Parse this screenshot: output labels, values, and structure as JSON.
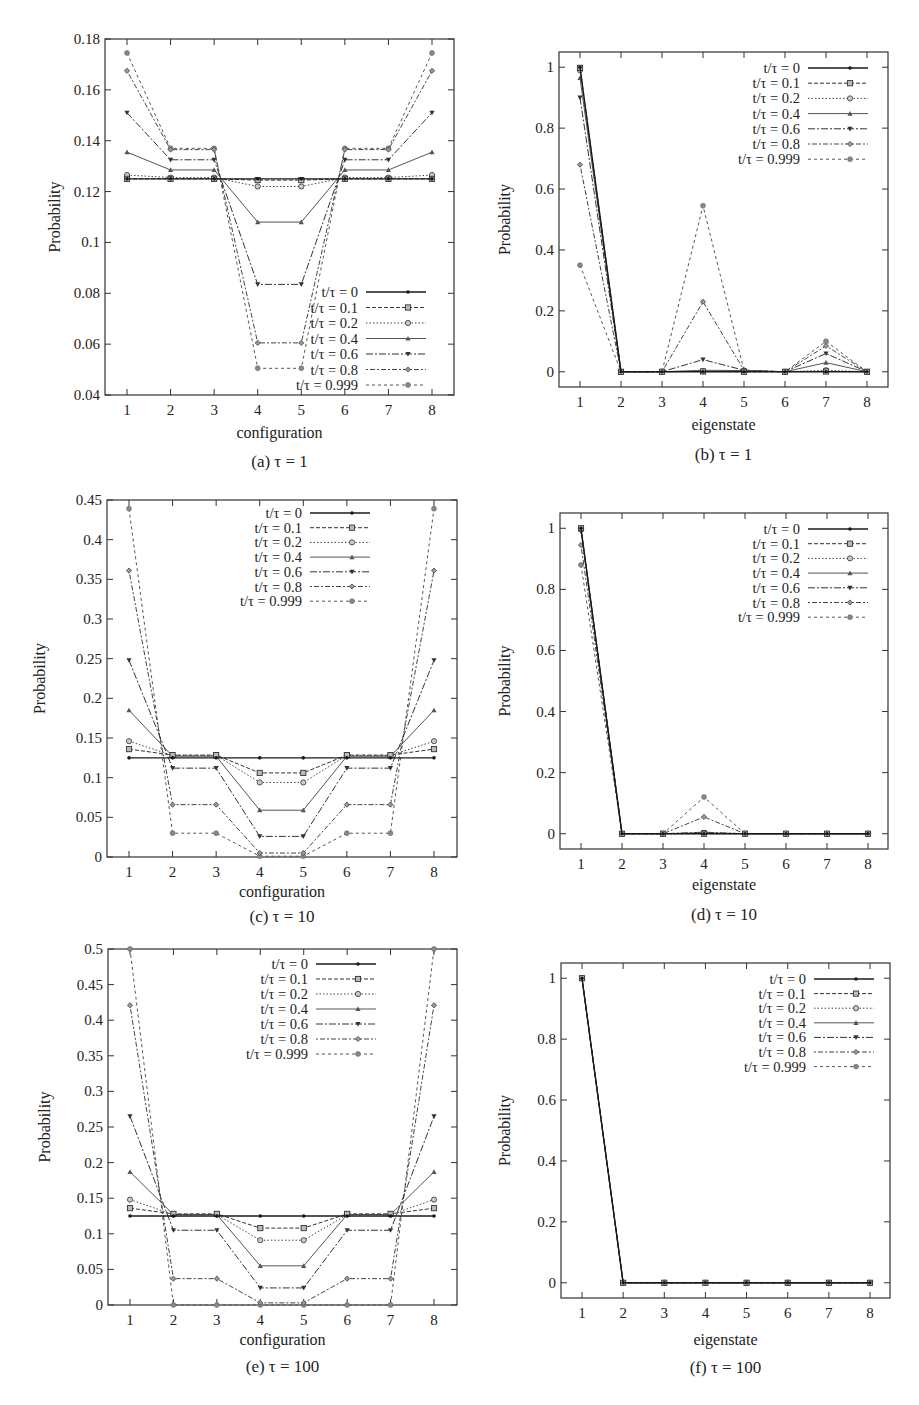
{
  "figure": {
    "series_labels": [
      "t/τ = 0",
      "t/τ = 0.1",
      "t/τ = 0.2",
      "t/τ = 0.4",
      "t/τ = 0.6",
      "t/τ = 0.8",
      "t/τ = 0.999"
    ]
  },
  "chart_data": [
    {
      "id": "a",
      "type": "line",
      "title": "(a) τ = 1",
      "xlabel": "configuration",
      "ylabel": "Probability",
      "categories": [
        1,
        2,
        3,
        4,
        5,
        6,
        7,
        8
      ],
      "ylim": [
        0.04,
        0.18
      ],
      "yticks": [
        0.04,
        0.06,
        0.08,
        0.1,
        0.12,
        0.14,
        0.16,
        0.18
      ],
      "ytick_labels": [
        "0.04",
        "0.06",
        "0.08",
        "0.1",
        "0.12",
        "0.14",
        "0.16",
        "0.18"
      ],
      "grid": false,
      "legend_position": "lower right",
      "series": [
        {
          "name": "t/τ = 0",
          "values": [
            0.125,
            0.125,
            0.125,
            0.125,
            0.125,
            0.125,
            0.125,
            0.125
          ]
        },
        {
          "name": "t/τ = 0.1",
          "values": [
            0.125,
            0.125,
            0.125,
            0.1245,
            0.1245,
            0.125,
            0.125,
            0.125
          ]
        },
        {
          "name": "t/τ = 0.2",
          "values": [
            0.1265,
            0.1255,
            0.1255,
            0.122,
            0.122,
            0.1255,
            0.1255,
            0.1265
          ]
        },
        {
          "name": "t/τ = 0.4",
          "values": [
            0.1355,
            0.1285,
            0.1285,
            0.108,
            0.108,
            0.1285,
            0.1285,
            0.1355
          ]
        },
        {
          "name": "t/τ = 0.6",
          "values": [
            0.151,
            0.1325,
            0.1325,
            0.0835,
            0.0835,
            0.1325,
            0.1325,
            0.151
          ]
        },
        {
          "name": "t/τ = 0.8",
          "values": [
            0.1675,
            0.1365,
            0.1365,
            0.0605,
            0.0605,
            0.1365,
            0.1365,
            0.1675
          ]
        },
        {
          "name": "t/τ = 0.999",
          "values": [
            0.1745,
            0.137,
            0.137,
            0.0505,
            0.0505,
            0.137,
            0.137,
            0.1745
          ]
        }
      ]
    },
    {
      "id": "b",
      "type": "line",
      "title": "(b) τ = 1",
      "xlabel": "eigenstate",
      "ylabel": "Probability",
      "categories": [
        1,
        2,
        3,
        4,
        5,
        6,
        7,
        8
      ],
      "ylim": [
        -0.05,
        1.05
      ],
      "yticks": [
        0,
        0.2,
        0.4,
        0.6,
        0.8,
        1
      ],
      "ytick_labels": [
        "0",
        "0.2",
        "0.4",
        "0.6",
        "0.8",
        "1"
      ],
      "grid": false,
      "legend_position": "upper right",
      "series": [
        {
          "name": "t/τ = 0",
          "values": [
            1.0,
            0,
            0,
            0,
            0,
            0,
            0,
            0
          ]
        },
        {
          "name": "t/τ = 0.1",
          "values": [
            0.998,
            0,
            0,
            0.001,
            0,
            0,
            0.001,
            0
          ]
        },
        {
          "name": "t/τ = 0.2",
          "values": [
            0.99,
            0,
            0,
            0.002,
            0.002,
            0,
            0.005,
            0
          ]
        },
        {
          "name": "t/τ = 0.4",
          "values": [
            0.965,
            0,
            0,
            0.005,
            0.004,
            0,
            0.03,
            0
          ]
        },
        {
          "name": "t/τ = 0.6",
          "values": [
            0.9,
            0,
            0,
            0.04,
            0.005,
            0,
            0.06,
            0
          ]
        },
        {
          "name": "t/τ = 0.8",
          "values": [
            0.68,
            0,
            0,
            0.23,
            0.005,
            0,
            0.085,
            0
          ]
        },
        {
          "name": "t/τ = 0.999",
          "values": [
            0.35,
            0,
            0,
            0.545,
            0.005,
            0,
            0.1,
            0
          ]
        }
      ]
    },
    {
      "id": "c",
      "type": "line",
      "title": "(c) τ = 10",
      "xlabel": "configuration",
      "ylabel": "Probability",
      "categories": [
        1,
        2,
        3,
        4,
        5,
        6,
        7,
        8
      ],
      "ylim": [
        0,
        0.45
      ],
      "yticks": [
        0,
        0.05,
        0.1,
        0.15,
        0.2,
        0.25,
        0.3,
        0.35,
        0.4,
        0.45
      ],
      "ytick_labels": [
        "0",
        "0.05",
        "0.1",
        "0.15",
        "0.2",
        "0.25",
        "0.3",
        "0.35",
        "0.4",
        "0.45"
      ],
      "grid": false,
      "legend_position": "upper center",
      "series": [
        {
          "name": "t/τ = 0",
          "values": [
            0.125,
            0.125,
            0.125,
            0.125,
            0.125,
            0.125,
            0.125,
            0.125
          ]
        },
        {
          "name": "t/τ = 0.1",
          "values": [
            0.136,
            0.1285,
            0.1285,
            0.106,
            0.106,
            0.1285,
            0.1285,
            0.136
          ]
        },
        {
          "name": "t/τ = 0.2",
          "values": [
            0.146,
            0.128,
            0.128,
            0.094,
            0.094,
            0.128,
            0.128,
            0.146
          ]
        },
        {
          "name": "t/τ = 0.4",
          "values": [
            0.185,
            0.127,
            0.127,
            0.059,
            0.059,
            0.127,
            0.127,
            0.185
          ]
        },
        {
          "name": "t/τ = 0.6",
          "values": [
            0.248,
            0.112,
            0.112,
            0.026,
            0.026,
            0.112,
            0.112,
            0.248
          ]
        },
        {
          "name": "t/τ = 0.8",
          "values": [
            0.361,
            0.066,
            0.066,
            0.005,
            0.005,
            0.066,
            0.066,
            0.361
          ]
        },
        {
          "name": "t/τ = 0.999",
          "values": [
            0.439,
            0.03,
            0.03,
            0.001,
            0.001,
            0.03,
            0.03,
            0.439
          ]
        }
      ]
    },
    {
      "id": "d",
      "type": "line",
      "title": "(d) τ = 10",
      "xlabel": "eigenstate",
      "ylabel": "Probability",
      "categories": [
        1,
        2,
        3,
        4,
        5,
        6,
        7,
        8
      ],
      "ylim": [
        -0.05,
        1.05
      ],
      "yticks": [
        0,
        0.2,
        0.4,
        0.6,
        0.8,
        1
      ],
      "ytick_labels": [
        "0",
        "0.2",
        "0.4",
        "0.6",
        "0.8",
        "1"
      ],
      "grid": false,
      "legend_position": "upper right",
      "series": [
        {
          "name": "t/τ = 0",
          "values": [
            1.0,
            0,
            0,
            0,
            0,
            0,
            0,
            0
          ]
        },
        {
          "name": "t/τ = 0.1",
          "values": [
            1.0,
            0,
            0,
            0.0,
            0,
            0,
            0,
            0
          ]
        },
        {
          "name": "t/τ = 0.2",
          "values": [
            0.999,
            0,
            0,
            0.001,
            0,
            0,
            0,
            0
          ]
        },
        {
          "name": "t/τ = 0.4",
          "values": [
            0.995,
            0,
            0,
            0.003,
            0,
            0,
            0,
            0
          ]
        },
        {
          "name": "t/τ = 0.6",
          "values": [
            0.99,
            0,
            0,
            0.005,
            0,
            0,
            0,
            0
          ]
        },
        {
          "name": "t/τ = 0.8",
          "values": [
            0.945,
            0,
            0,
            0.055,
            0,
            0,
            0,
            0
          ]
        },
        {
          "name": "t/τ = 0.999",
          "values": [
            0.88,
            0,
            0,
            0.12,
            0,
            0,
            0,
            0
          ]
        }
      ]
    },
    {
      "id": "e",
      "type": "line",
      "title": "(e) τ = 100",
      "xlabel": "configuration",
      "ylabel": "Probability",
      "categories": [
        1,
        2,
        3,
        4,
        5,
        6,
        7,
        8
      ],
      "ylim": [
        0,
        0.5
      ],
      "yticks": [
        0,
        0.05,
        0.1,
        0.15,
        0.2,
        0.25,
        0.3,
        0.35,
        0.4,
        0.45,
        0.5
      ],
      "ytick_labels": [
        "0",
        "0.05",
        "0.1",
        "0.15",
        "0.2",
        "0.25",
        "0.3",
        "0.35",
        "0.4",
        "0.45",
        "0.5"
      ],
      "grid": false,
      "legend_position": "upper center",
      "series": [
        {
          "name": "t/τ = 0",
          "values": [
            0.125,
            0.125,
            0.125,
            0.125,
            0.125,
            0.125,
            0.125,
            0.125
          ]
        },
        {
          "name": "t/τ = 0.1",
          "values": [
            0.136,
            0.128,
            0.128,
            0.108,
            0.108,
            0.128,
            0.128,
            0.136
          ]
        },
        {
          "name": "t/τ = 0.2",
          "values": [
            0.148,
            0.127,
            0.127,
            0.091,
            0.091,
            0.127,
            0.127,
            0.148
          ]
        },
        {
          "name": "t/τ = 0.4",
          "values": [
            0.187,
            0.127,
            0.127,
            0.055,
            0.055,
            0.127,
            0.127,
            0.187
          ]
        },
        {
          "name": "t/τ = 0.6",
          "values": [
            0.265,
            0.105,
            0.105,
            0.024,
            0.024,
            0.105,
            0.105,
            0.265
          ]
        },
        {
          "name": "t/τ = 0.8",
          "values": [
            0.421,
            0.037,
            0.037,
            0.003,
            0.003,
            0.037,
            0.037,
            0.421
          ]
        },
        {
          "name": "t/τ = 0.999",
          "values": [
            0.5,
            0.0,
            0.0,
            0.0,
            0.0,
            0.0,
            0.0,
            0.5
          ]
        }
      ]
    },
    {
      "id": "f",
      "type": "line",
      "title": "(f) τ = 100",
      "xlabel": "eigenstate",
      "ylabel": "Probability",
      "categories": [
        1,
        2,
        3,
        4,
        5,
        6,
        7,
        8
      ],
      "ylim": [
        -0.05,
        1.05
      ],
      "yticks": [
        0,
        0.2,
        0.4,
        0.6,
        0.8,
        1
      ],
      "ytick_labels": [
        "0",
        "0.2",
        "0.4",
        "0.6",
        "0.8",
        "1"
      ],
      "grid": false,
      "legend_position": "upper right",
      "series": [
        {
          "name": "t/τ = 0",
          "values": [
            1.0,
            0,
            0,
            0,
            0,
            0,
            0,
            0
          ]
        },
        {
          "name": "t/τ = 0.1",
          "values": [
            1.0,
            0,
            0,
            0,
            0,
            0,
            0,
            0
          ]
        },
        {
          "name": "t/τ = 0.2",
          "values": [
            1.0,
            0,
            0,
            0,
            0,
            0,
            0,
            0
          ]
        },
        {
          "name": "t/τ = 0.4",
          "values": [
            1.0,
            0,
            0,
            0,
            0,
            0,
            0,
            0
          ]
        },
        {
          "name": "t/τ = 0.6",
          "values": [
            1.0,
            0,
            0,
            0,
            0,
            0,
            0,
            0
          ]
        },
        {
          "name": "t/τ = 0.8",
          "values": [
            1.0,
            0,
            0,
            0,
            0,
            0,
            0,
            0
          ]
        },
        {
          "name": "t/τ = 0.999",
          "values": [
            1.0,
            0,
            0,
            0,
            0,
            0,
            0,
            0
          ]
        }
      ]
    }
  ]
}
